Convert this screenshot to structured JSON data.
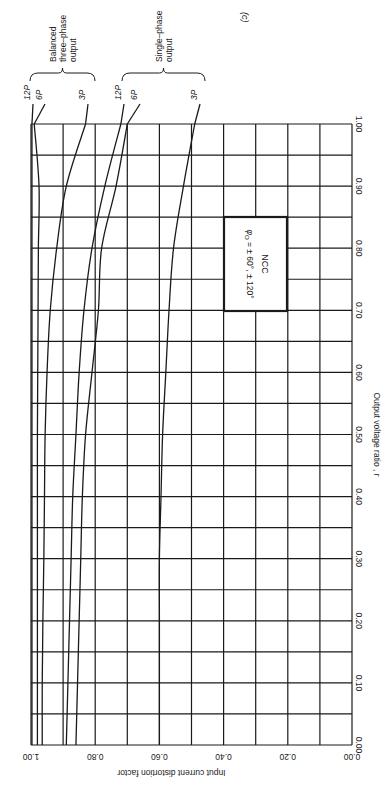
{
  "figure_label": "(c)",
  "chart_data": {
    "type": "line",
    "orientation_note": "figure printed rotated 90 degrees clockwise",
    "title": "",
    "xlabel": "Output voltage ratio , r",
    "ylabel": "Input current distortion factor",
    "xlim": [
      0.0,
      1.0
    ],
    "ylim": [
      0.0,
      1.0
    ],
    "x_ticks": [
      "0.00",
      "0.10",
      "0.20",
      "0.30",
      "0.40",
      "0.50",
      "0.60",
      "0.70",
      "0.80",
      "0.90",
      "1.00"
    ],
    "y_ticks": [
      "0.00",
      "0.20",
      "0.40",
      "0.60",
      "0.80",
      "1.00"
    ],
    "grid": true,
    "x": [
      0.0,
      0.1,
      0.2,
      0.3,
      0.4,
      0.5,
      0.6,
      0.7,
      0.8,
      0.9,
      1.0
    ],
    "groups": [
      {
        "name": "Balanced three-phase output",
        "label_lines": [
          "Balanced",
          "three–phase",
          "output"
        ],
        "series_names": [
          "12P",
          "6P",
          "3P"
        ]
      },
      {
        "name": "Single-phase output",
        "label_lines": [
          "Single–phase",
          "output"
        ],
        "series_names": [
          "12P",
          "6P",
          "3P"
        ]
      }
    ],
    "series": [
      {
        "name": "12P",
        "group": "Balanced three-phase output",
        "values": [
          0.997,
          0.997,
          0.997,
          0.997,
          0.997,
          0.997,
          0.997,
          0.997,
          0.997,
          0.997,
          0.997
        ]
      },
      {
        "name": "6P",
        "group": "Balanced three-phase output",
        "values": [
          0.98,
          0.98,
          0.98,
          0.98,
          0.98,
          0.98,
          0.979,
          0.978,
          0.977,
          0.975,
          0.99
        ]
      },
      {
        "name": "3P",
        "group": "Balanced three-phase output",
        "values": [
          0.965,
          0.965,
          0.963,
          0.96,
          0.958,
          0.956,
          0.95,
          0.94,
          0.92,
          0.89,
          0.83
        ]
      },
      {
        "name": "12P",
        "group": "Single-phase output",
        "values": [
          0.89,
          0.885,
          0.88,
          0.875,
          0.87,
          0.86,
          0.85,
          0.835,
          0.81,
          0.77,
          0.72
        ]
      },
      {
        "name": "6P",
        "group": "Single-phase output",
        "values": [
          0.86,
          0.855,
          0.85,
          0.845,
          0.84,
          0.83,
          0.81,
          0.79,
          0.78,
          0.735,
          0.7
        ]
      },
      {
        "name": "3P",
        "group": "Single-phase output",
        "values": [
          0.6,
          0.6,
          0.6,
          0.6,
          0.595,
          0.59,
          0.58,
          0.57,
          0.556,
          0.525,
          0.49
        ]
      }
    ],
    "annotations": [
      {
        "text": "NCC",
        "type": "box"
      },
      {
        "text": "φo = ± 60°, ± 120°",
        "type": "box"
      }
    ]
  },
  "annotation_box": {
    "title": "NCC",
    "formula_symbol": "φ",
    "formula_subscript": "O",
    "formula_rest": " = ± 60°, ± 120°"
  },
  "colors": {
    "ink": "#1a1a1a",
    "background": "#ffffff"
  }
}
